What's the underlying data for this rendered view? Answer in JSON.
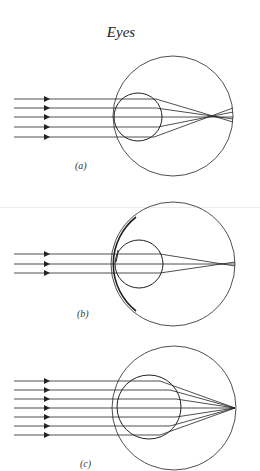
{
  "title": "Eyes",
  "panels": [
    {
      "id": "a",
      "label": "(a)",
      "rays": 5,
      "description": "Parallel rays focus in front of the retina"
    },
    {
      "id": "b",
      "label": "(b)",
      "rays": 3,
      "description": "Corrective lens in front of eye, rays focus on retina"
    },
    {
      "id": "c",
      "label": "(c)",
      "rays": 7,
      "description": "Larger lens, rays converge to point on retina"
    }
  ],
  "colors": {
    "stroke": "#222222",
    "background": "#ffffff"
  }
}
